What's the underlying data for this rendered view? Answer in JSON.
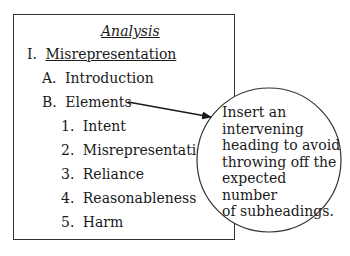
{
  "outline": {
    "title": "Analysis",
    "level1": {
      "marker": "I.",
      "label": "Misrepresentation"
    },
    "level2": [
      {
        "marker": "A.",
        "label": "Introduction"
      },
      {
        "marker": "B.",
        "label": "Elements"
      }
    ],
    "level3": [
      {
        "marker": "1.",
        "label": "Intent"
      },
      {
        "marker": "2.",
        "label": "Misrepresentation"
      },
      {
        "marker": "3.",
        "label": "Reliance"
      },
      {
        "marker": "4.",
        "label": "Reasonableness"
      },
      {
        "marker": "5.",
        "label": "Harm"
      }
    ]
  },
  "callout": {
    "lines": [
      "Insert an",
      "intervening",
      "heading to avoid",
      "throwing off the",
      "expected number",
      "of subheadings."
    ],
    "points_to": "B. Elements"
  }
}
